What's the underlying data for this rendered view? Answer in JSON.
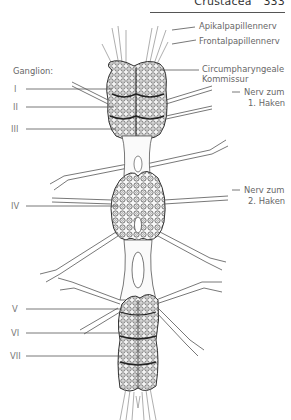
{
  "header": {
    "section": "Crustacea",
    "page_number": "333"
  },
  "labels": {
    "ganglion_title": "Ganglion:",
    "right": [
      {
        "id": "apikal",
        "text": "Apikalpapillennerv"
      },
      {
        "id": "frontal",
        "text": "Frontalpapillennerv"
      },
      {
        "id": "circum_1",
        "text": "Circumpharyngeale"
      },
      {
        "id": "circum_2",
        "text": "Kommissur"
      },
      {
        "id": "nerv1_1",
        "text": "Nerv zum"
      },
      {
        "id": "nerv1_2",
        "text": "1. Haken"
      },
      {
        "id": "nerv2_1",
        "text": "Nerv zum"
      },
      {
        "id": "nerv2_2",
        "text": "2. Haken"
      }
    ],
    "ganglia": [
      "I",
      "II",
      "III",
      "IV",
      "V",
      "VI",
      "VII"
    ]
  },
  "colors": {
    "ink": "#333333",
    "label_text": "#666666",
    "leader_line": "#555555"
  }
}
